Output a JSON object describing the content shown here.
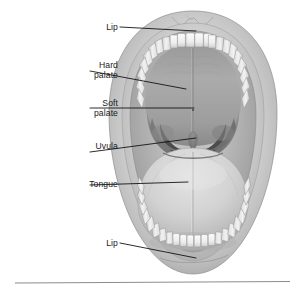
{
  "figure": {
    "style": "grayscale medical illustration",
    "colors": {
      "background": "#ffffff",
      "leader_line": "#141414",
      "label_text": "#1a1a1a",
      "lip_outer": "#b9b9b9",
      "lip_inner": "#cfcfcf",
      "gum": "#a9a9a9",
      "tooth": "#f2f2f2",
      "tooth_shadow": "#b4b4b4",
      "hard_palate": "#a6a6a6",
      "soft_palate": "#8e8e8e",
      "oropharynx": "#4e4e4e",
      "uvula": "#7a7a7a",
      "tongue": "#d2d2d2",
      "tongue_shadow": "#ababab",
      "rule": "#8c8c8c"
    }
  },
  "labels": [
    {
      "id": "lip-top",
      "text": "Lip",
      "part": "upper lip"
    },
    {
      "id": "hard-palate",
      "text": "Hard\npalate",
      "part": "hard palate"
    },
    {
      "id": "soft-palate",
      "text": "Soft\npalate",
      "part": "soft palate"
    },
    {
      "id": "uvula",
      "text": "Uvula",
      "part": "uvula"
    },
    {
      "id": "tongue",
      "text": "Tongue",
      "part": "tongue"
    },
    {
      "id": "lip-bottom",
      "text": "Lip",
      "part": "lower lip"
    }
  ],
  "footer": {
    "rule": "horizontal-divider"
  }
}
